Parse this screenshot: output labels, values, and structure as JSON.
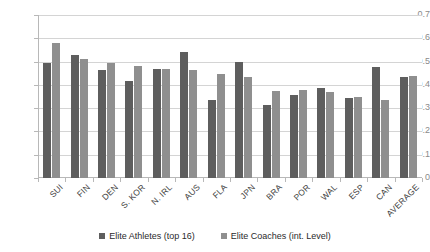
{
  "chart_data": {
    "type": "bar",
    "title": "",
    "subtitle": "",
    "xlabel": "",
    "ylabel": "",
    "ylim": [
      0,
      0.7
    ],
    "ytick_labels": [
      "0.7",
      "0.6",
      "0.5",
      "0.4",
      "0.3",
      "0.2",
      "0.1",
      "0"
    ],
    "ytick_values": [
      0.7,
      0.6,
      0.5,
      0.4,
      0.3,
      0.2,
      0.1,
      0
    ],
    "grid": true,
    "legend_position": "bottom",
    "categories": [
      "SUI",
      "FIN",
      "DEN",
      "S. KOR",
      "N. IRL",
      "AUS",
      "FLA",
      "JPN",
      "BRA",
      "POR",
      "WAL",
      "ESP",
      "CAN",
      "AVERAGE"
    ],
    "series": [
      {
        "name": "Elite Athletes (top 16)",
        "color": "#5e5e5e",
        "values": [
          0.495,
          0.53,
          0.465,
          0.415,
          0.47,
          0.54,
          0.335,
          0.5,
          0.315,
          0.355,
          0.385,
          0.345,
          0.475,
          0.435
        ]
      },
      {
        "name": "Elite Coaches (int. Level)",
        "color": "#8f8f8f",
        "values": [
          0.58,
          0.51,
          0.495,
          0.48,
          0.47,
          0.465,
          0.445,
          0.435,
          0.375,
          0.38,
          0.37,
          0.35,
          0.335,
          0.44
        ]
      }
    ]
  },
  "colors": {
    "series_1": "#5e5e5e",
    "series_2": "#8f8f8f",
    "gridline": "#d4d4d4",
    "axis": "#b8b8b8",
    "tick_text": "#8a8a8a",
    "label_text": "#3d3d3d",
    "background": "#ffffff"
  }
}
